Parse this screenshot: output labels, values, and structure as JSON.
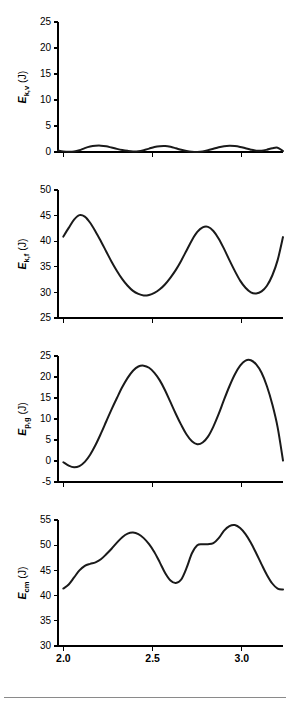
{
  "figure": {
    "xlabel": "Time (s)",
    "x_ticks": [
      "2.0",
      "2.5",
      "3.0"
    ],
    "x_tick_values": [
      2.0,
      2.5,
      3.0
    ],
    "line_color": "#1a1a1a",
    "axis_color": "#000000"
  },
  "chart_data": [
    {
      "type": "line",
      "panel_index": 0,
      "title": "",
      "ylabel": "E_k,v (J)",
      "ylabel_main": "E",
      "ylabel_subscript": "k,v",
      "ylabel_unit": " (J)",
      "xlabel": "",
      "ylim": [
        0,
        25
      ],
      "xlim": [
        1.97,
        3.23
      ],
      "y_ticks": [
        0,
        5,
        10,
        15,
        20,
        25
      ],
      "y_tick_labels": [
        "0",
        "5",
        "10",
        "15",
        "20",
        "25"
      ],
      "grid": false,
      "legend": "none",
      "series": [
        {
          "name": "E_k,v",
          "x": [
            1.97,
            2.0,
            2.03,
            2.06,
            2.09,
            2.12,
            2.15,
            2.18,
            2.21,
            2.24,
            2.27,
            2.3,
            2.33,
            2.36,
            2.39,
            2.42,
            2.45,
            2.48,
            2.51,
            2.54,
            2.57,
            2.6,
            2.63,
            2.66,
            2.69,
            2.72,
            2.75,
            2.78,
            2.81,
            2.84,
            2.87,
            2.9,
            2.93,
            2.96,
            2.99,
            3.02,
            3.05,
            3.08,
            3.11,
            3.14,
            3.17,
            3.2,
            3.23
          ],
          "y": [
            0.3,
            0.12,
            0.05,
            0.1,
            0.35,
            0.75,
            1.05,
            1.2,
            1.22,
            1.1,
            0.85,
            0.6,
            0.38,
            0.22,
            0.12,
            0.15,
            0.35,
            0.65,
            0.95,
            1.12,
            1.15,
            1.0,
            0.72,
            0.42,
            0.18,
            0.05,
            0.02,
            0.1,
            0.32,
            0.62,
            0.92,
            1.12,
            1.2,
            1.15,
            0.98,
            0.72,
            0.45,
            0.25,
            0.25,
            0.45,
            0.72,
            0.82,
            0.18
          ]
        }
      ]
    },
    {
      "type": "line",
      "panel_index": 1,
      "title": "",
      "ylabel": "E_k,f (J)",
      "ylabel_main": "E",
      "ylabel_subscript": "k,f",
      "ylabel_unit": " (J)",
      "xlabel": "",
      "ylim": [
        25,
        50
      ],
      "xlim": [
        1.97,
        3.23
      ],
      "y_ticks": [
        25,
        30,
        35,
        40,
        45,
        50
      ],
      "y_tick_labels": [
        "25",
        "30",
        "35",
        "40",
        "45",
        "50"
      ],
      "grid": false,
      "legend": "none",
      "series": [
        {
          "name": "E_k,f",
          "x": [
            2.0,
            2.03,
            2.06,
            2.09,
            2.12,
            2.15,
            2.18,
            2.21,
            2.24,
            2.27,
            2.3,
            2.33,
            2.36,
            2.39,
            2.42,
            2.45,
            2.48,
            2.51,
            2.54,
            2.57,
            2.6,
            2.63,
            2.66,
            2.69,
            2.72,
            2.75,
            2.78,
            2.81,
            2.84,
            2.87,
            2.9,
            2.93,
            2.96,
            2.99,
            3.02,
            3.05,
            3.08,
            3.11,
            3.14,
            3.17,
            3.2,
            3.23
          ],
          "y": [
            40.9,
            42.6,
            44.2,
            45.1,
            44.8,
            43.6,
            41.9,
            40.0,
            38.0,
            36.0,
            34.2,
            32.6,
            31.3,
            30.3,
            29.7,
            29.4,
            29.5,
            29.9,
            30.6,
            31.6,
            32.9,
            34.4,
            36.2,
            38.2,
            40.2,
            41.8,
            42.7,
            42.8,
            42.0,
            40.5,
            38.5,
            36.3,
            34.2,
            32.3,
            30.9,
            30.0,
            29.8,
            30.2,
            31.3,
            33.3,
            36.3,
            40.8
          ]
        }
      ]
    },
    {
      "type": "line",
      "panel_index": 2,
      "title": "",
      "ylabel": "E_p,g (J)",
      "ylabel_main": "E",
      "ylabel_subscript": "p,g",
      "ylabel_unit": " (J)",
      "xlabel": "",
      "ylim": [
        -5,
        25
      ],
      "xlim": [
        1.97,
        3.23
      ],
      "y_ticks": [
        -5,
        0,
        5,
        10,
        15,
        20,
        25
      ],
      "y_tick_labels": [
        "-5",
        "0",
        "5",
        "10",
        "15",
        "20",
        "25"
      ],
      "grid": false,
      "legend": "none",
      "series": [
        {
          "name": "E_p,g",
          "x": [
            2.0,
            2.03,
            2.06,
            2.09,
            2.12,
            2.15,
            2.18,
            2.21,
            2.24,
            2.27,
            2.3,
            2.33,
            2.36,
            2.39,
            2.42,
            2.45,
            2.48,
            2.51,
            2.54,
            2.57,
            2.6,
            2.63,
            2.66,
            2.69,
            2.72,
            2.75,
            2.78,
            2.81,
            2.84,
            2.87,
            2.9,
            2.93,
            2.96,
            2.99,
            3.02,
            3.05,
            3.08,
            3.11,
            3.14,
            3.17,
            3.2,
            3.23
          ],
          "y": [
            -0.3,
            -1.1,
            -1.5,
            -1.2,
            -0.2,
            1.5,
            3.8,
            6.5,
            9.4,
            12.3,
            15.0,
            17.6,
            19.8,
            21.5,
            22.5,
            22.7,
            22.2,
            21.0,
            19.2,
            16.8,
            14.0,
            11.2,
            8.6,
            6.3,
            4.7,
            4.0,
            4.4,
            5.8,
            8.2,
            11.2,
            14.6,
            17.8,
            20.6,
            22.7,
            23.9,
            24.0,
            23.0,
            21.0,
            17.8,
            13.5,
            8.0,
            0.1
          ]
        }
      ]
    },
    {
      "type": "line",
      "panel_index": 3,
      "title": "",
      "ylabel": "E_cm (J)",
      "ylabel_main": "E",
      "ylabel_subscript": "cm",
      "ylabel_unit": " (J)",
      "xlabel": "Time (s)",
      "ylim": [
        30,
        55
      ],
      "xlim": [
        1.97,
        3.23
      ],
      "y_ticks": [
        30,
        35,
        40,
        45,
        50,
        55
      ],
      "y_tick_labels": [
        "30",
        "35",
        "40",
        "45",
        "50",
        "55"
      ],
      "grid": false,
      "legend": "none",
      "series": [
        {
          "name": "E_cm",
          "x": [
            2.0,
            2.03,
            2.06,
            2.09,
            2.12,
            2.15,
            2.18,
            2.21,
            2.24,
            2.27,
            2.3,
            2.33,
            2.36,
            2.39,
            2.42,
            2.45,
            2.48,
            2.51,
            2.54,
            2.57,
            2.6,
            2.63,
            2.66,
            2.69,
            2.72,
            2.75,
            2.78,
            2.81,
            2.84,
            2.87,
            2.9,
            2.93,
            2.96,
            2.99,
            3.02,
            3.05,
            3.08,
            3.11,
            3.14,
            3.17,
            3.2,
            3.23
          ],
          "y": [
            41.4,
            42.2,
            43.6,
            45.0,
            45.9,
            46.3,
            46.6,
            47.2,
            48.2,
            49.3,
            50.5,
            51.6,
            52.3,
            52.5,
            52.2,
            51.4,
            50.2,
            48.6,
            46.6,
            44.5,
            43.0,
            42.5,
            43.2,
            45.5,
            48.4,
            50.0,
            50.2,
            50.2,
            50.4,
            51.4,
            52.9,
            53.8,
            54.0,
            53.4,
            52.2,
            50.5,
            48.4,
            46.2,
            44.1,
            42.4,
            41.4,
            41.2
          ]
        }
      ]
    }
  ]
}
